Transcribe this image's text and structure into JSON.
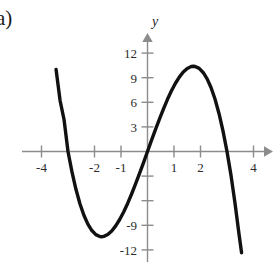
{
  "figure": {
    "part_label": "a)",
    "background_color": "#ffffff",
    "curve_color": "#111111",
    "axis_color": "#8c8c8c",
    "text_color": "#2b2b2b"
  },
  "chart_data": {
    "type": "line",
    "title": "",
    "xlabel": "",
    "ylabel": "y",
    "x_axis_name": "",
    "y_axis_name": "y",
    "xlim": [
      -3.9,
      4.7
    ],
    "ylim": [
      -13.5,
      13.5
    ],
    "grid": false,
    "legend": "none",
    "x_ticks": [
      -4,
      -2,
      -1,
      1,
      2,
      4
    ],
    "x_tick_labels": [
      "-4",
      "-2",
      "-1",
      "1",
      "2",
      "4"
    ],
    "y_ticks": [
      12,
      9,
      6,
      3,
      -3,
      -6,
      -9,
      -12
    ],
    "y_tick_labels": [
      "12",
      "9",
      "6",
      "3",
      "",
      "",
      "-9",
      "-12"
    ],
    "y_unlabeled_ticks": [
      -3,
      -6
    ],
    "series": [
      {
        "name": "cubic",
        "equation": "y = -x^3 + 9x",
        "roots": [
          -3,
          0,
          3
        ],
        "local_minimum": [
          -1.73,
          -10.39
        ],
        "local_maximum": [
          1.73,
          10.39
        ],
        "x_range": [
          -3.45,
          3.55
        ],
        "x": [
          -3.45,
          -3.3,
          -3.15,
          -3.0,
          -2.85,
          -2.7,
          -2.55,
          -2.4,
          -2.25,
          -2.1,
          -1.95,
          -1.8,
          -1.73,
          -1.65,
          -1.5,
          -1.35,
          -1.2,
          -1.05,
          -0.9,
          -0.75,
          -0.6,
          -0.45,
          -0.3,
          -0.15,
          0,
          0.15,
          0.3,
          0.45,
          0.6,
          0.75,
          0.9,
          1.05,
          1.2,
          1.35,
          1.5,
          1.65,
          1.73,
          1.8,
          1.95,
          2.1,
          2.25,
          2.4,
          2.55,
          2.7,
          2.85,
          3.0,
          3.15,
          3.3,
          3.45,
          3.55
        ],
        "y": [
          10.01,
          6.24,
          3.9,
          0.0,
          -2.49,
          -4.61,
          -6.37,
          -7.78,
          -8.86,
          -9.64,
          -10.14,
          -10.37,
          -10.39,
          -10.35,
          -10.13,
          -9.69,
          -9.07,
          -8.29,
          -7.37,
          -6.33,
          -5.18,
          -3.96,
          -2.67,
          -1.35,
          0.0,
          1.35,
          2.67,
          3.96,
          5.18,
          6.33,
          7.37,
          8.29,
          9.07,
          9.69,
          10.13,
          10.36,
          10.39,
          10.37,
          10.14,
          9.64,
          8.86,
          7.78,
          6.37,
          4.61,
          2.49,
          0.0,
          -2.88,
          -6.24,
          -10.01,
          -12.36
        ]
      }
    ]
  },
  "axes": {
    "origin_px": [
      147.5,
      151.5
    ],
    "x_scale_px_per_unit": 26.5,
    "y_scale_px_per_unit": 8.2
  }
}
